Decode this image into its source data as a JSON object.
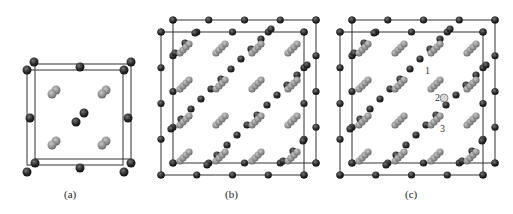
{
  "figure": {
    "panels": [
      {
        "id": "a",
        "caption": "(a)",
        "description": "single unit cell"
      },
      {
        "id": "b",
        "caption": "(b)",
        "description": "supercell"
      },
      {
        "id": "c",
        "caption": "(c)",
        "description": "supercell with substitution sites"
      }
    ],
    "site_labels": [
      "1",
      "2",
      "3"
    ],
    "colors": {
      "dark_atom": "#2b2b2b",
      "light_atom": "#8c8c8c",
      "hatched_atom": "#dddddd",
      "cell_edge": "#333333"
    }
  }
}
